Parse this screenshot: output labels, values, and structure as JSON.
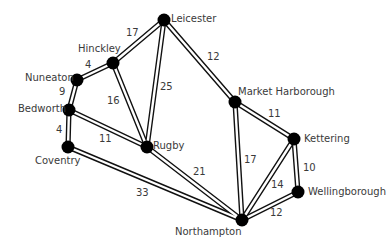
{
  "diagram": {
    "type": "weighted-graph",
    "nodes": [
      {
        "id": "leicester",
        "label": "Leicester",
        "x": 164,
        "y": 20,
        "lx": 171,
        "ly": 14
      },
      {
        "id": "hinckley",
        "label": "Hinckley",
        "x": 113,
        "y": 63,
        "lx": 78,
        "ly": 44
      },
      {
        "id": "nuneaton",
        "label": "Nuneaton",
        "x": 77,
        "y": 80,
        "lx": 25,
        "ly": 73
      },
      {
        "id": "bedworth",
        "label": "Bedworth",
        "x": 69,
        "y": 110,
        "lx": 18,
        "ly": 104
      },
      {
        "id": "coventry",
        "label": "Coventry",
        "x": 68,
        "y": 147,
        "lx": 35,
        "ly": 156
      },
      {
        "id": "rugby",
        "label": "Rugby",
        "x": 147,
        "y": 147,
        "lx": 153,
        "ly": 141
      },
      {
        "id": "market-harborough",
        "label": "Market Harborough",
        "x": 235,
        "y": 102,
        "lx": 238,
        "ly": 87
      },
      {
        "id": "kettering",
        "label": "Kettering",
        "x": 294,
        "y": 139,
        "lx": 304,
        "ly": 134
      },
      {
        "id": "wellingborough",
        "label": "Wellingborough",
        "x": 298,
        "y": 192,
        "lx": 308,
        "ly": 187
      },
      {
        "id": "northampton",
        "label": "Northampton",
        "x": 242,
        "y": 220,
        "lx": 175,
        "ly": 227
      }
    ],
    "edges": [
      {
        "from": "hinckley",
        "to": "leicester",
        "weight": "17",
        "wx": 126,
        "wy": 28
      },
      {
        "from": "leicester",
        "to": "market-harborough",
        "weight": "12",
        "wx": 207,
        "wy": 52
      },
      {
        "from": "leicester",
        "to": "rugby",
        "weight": "25",
        "wx": 160,
        "wy": 82
      },
      {
        "from": "nuneaton",
        "to": "hinckley",
        "weight": "4",
        "wx": 85,
        "wy": 60
      },
      {
        "from": "hinckley",
        "to": "rugby",
        "weight": "16",
        "wx": 107,
        "wy": 96
      },
      {
        "from": "nuneaton",
        "to": "bedworth",
        "weight": "9",
        "wx": 59,
        "wy": 87
      },
      {
        "from": "bedworth",
        "to": "coventry",
        "weight": "4",
        "wx": 56,
        "wy": 125
      },
      {
        "from": "bedworth",
        "to": "rugby",
        "weight": "11",
        "wx": 99,
        "wy": 134
      },
      {
        "from": "coventry",
        "to": "northampton",
        "weight": "33",
        "wx": 136,
        "wy": 188
      },
      {
        "from": "rugby",
        "to": "northampton",
        "weight": "21",
        "wx": 193,
        "wy": 167
      },
      {
        "from": "market-harborough",
        "to": "kettering",
        "weight": "11",
        "wx": 268,
        "wy": 109
      },
      {
        "from": "market-harborough",
        "to": "northampton",
        "weight": "17",
        "wx": 244,
        "wy": 155
      },
      {
        "from": "kettering",
        "to": "northampton",
        "weight": "14",
        "wx": 271,
        "wy": 180
      },
      {
        "from": "kettering",
        "to": "wellingborough",
        "weight": "10",
        "wx": 303,
        "wy": 163
      },
      {
        "from": "wellingborough",
        "to": "northampton",
        "weight": "12",
        "wx": 270,
        "wy": 208
      }
    ]
  }
}
